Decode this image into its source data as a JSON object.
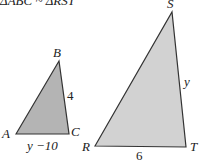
{
  "title": "ΔABC ~ ΔRST",
  "small_triangle": {
    "vertices": {
      "A": {
        "label": "A"
      },
      "B": {
        "label": "B"
      },
      "C": {
        "label": "C"
      }
    },
    "side_BC": "4",
    "side_AC": "y −10",
    "fill": "#b4b4b4"
  },
  "large_triangle": {
    "vertices": {
      "R": {
        "label": "R"
      },
      "S": {
        "label": "S"
      },
      "T": {
        "label": "T"
      }
    },
    "side_ST": "y",
    "side_RT": "6",
    "fill": "#d2d2d2"
  },
  "stroke_color": "#333333"
}
